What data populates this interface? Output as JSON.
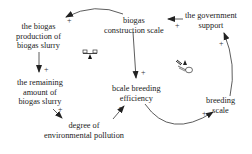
{
  "diagram": {
    "type": "causal-loop",
    "nodes": {
      "biogas_production": {
        "lines": [
          "the biogas",
          "production of",
          "biogas slurry"
        ]
      },
      "construction_scale": {
        "lines": [
          "biogas",
          "construction scale"
        ]
      },
      "government_support": {
        "lines": [
          "the government",
          "support"
        ]
      },
      "remaining_slurry": {
        "lines": [
          "the remaining",
          "amount of",
          "biogas slurry"
        ]
      },
      "breeding_efficiency": {
        "lines": [
          "bcale breeding",
          "efficiency"
        ]
      },
      "breeding_scale": {
        "lines": [
          "breeding",
          "scale"
        ]
      },
      "pollution": {
        "lines": [
          "degree of",
          "environmental pollution"
        ]
      }
    },
    "links": [
      {
        "from": "biogas construction scale",
        "to": "the biogas production of biogas slurry",
        "polarity": "+"
      },
      {
        "from": "the biogas production of biogas slurry",
        "to": "the remaining amount of biogas slurry",
        "polarity": "+"
      },
      {
        "from": "the remaining amount of biogas slurry",
        "to": "degree of environmental pollution",
        "polarity": "+"
      },
      {
        "from": "degree of environmental pollution",
        "to": "bcale breeding efficiency",
        "polarity": "-"
      },
      {
        "from": "biogas construction scale",
        "to": "bcale breeding efficiency",
        "polarity": "+"
      },
      {
        "from": "bcale breeding efficiency",
        "to": "breeding scale",
        "polarity": "+"
      },
      {
        "from": "breeding scale",
        "to": "the government support",
        "polarity": "+"
      },
      {
        "from": "the government support",
        "to": "biogas construction scale",
        "polarity": "+"
      }
    ],
    "loop_icons": [
      {
        "type": "balancing",
        "icon": "balance-scale-icon"
      },
      {
        "type": "reinforcing",
        "icon": "snowball-icon"
      }
    ]
  }
}
